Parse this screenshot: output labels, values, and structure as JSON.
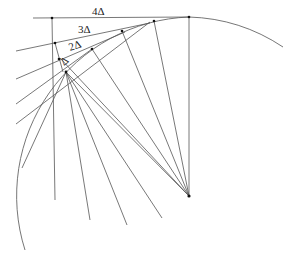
{
  "diagram": {
    "type": "geometric-construction",
    "labels": {
      "l4": "4Δ",
      "l3": "3Δ",
      "l2": "2Δ",
      "l1": "Δ"
    },
    "colors": {
      "stroke": "#555555",
      "arc": "#666666",
      "points": "#111111",
      "background": "#ffffff"
    }
  }
}
